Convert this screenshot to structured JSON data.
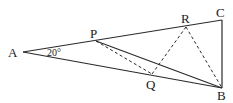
{
  "diagram": {
    "type": "geometry",
    "points": {
      "A": {
        "label": "A",
        "x": 23,
        "y": 52
      },
      "P": {
        "label": "P",
        "x": 96,
        "y": 41
      },
      "R": {
        "label": "R",
        "x": 186,
        "y": 27
      },
      "C": {
        "label": "C",
        "x": 222,
        "y": 20
      },
      "B": {
        "label": "B",
        "x": 222,
        "y": 88
      },
      "Q": {
        "label": "Q",
        "x": 152,
        "y": 74
      }
    },
    "angle_label": "20°",
    "solid_segments": [
      "AC",
      "AB",
      "CB",
      "PB"
    ],
    "dashed_segments": [
      "PQ",
      "QR",
      "RB"
    ]
  }
}
